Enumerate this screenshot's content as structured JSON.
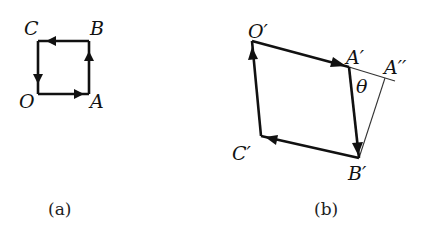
{
  "figure_a": {
    "caption": "(a)",
    "labels": {
      "O": "O",
      "A": "A",
      "B": "B",
      "C": "C"
    },
    "points": {
      "O": [
        38,
        94
      ],
      "A": [
        89,
        94
      ],
      "B": [
        89,
        41
      ],
      "C": [
        38,
        41
      ]
    }
  },
  "figure_b": {
    "caption": "(b)",
    "labels": {
      "O": "O′",
      "A": "A′",
      "B": "B′",
      "C": "C′",
      "A2": "A′′",
      "theta": "θ"
    },
    "points": {
      "O": [
        252,
        41
      ],
      "A": [
        349,
        67
      ],
      "B": [
        359,
        158
      ],
      "C": [
        261,
        136
      ],
      "A2": [
        385,
        78
      ],
      "line_end": [
        395,
        81
      ]
    }
  },
  "colors": {
    "stroke": "#111111",
    "background": "#ffffff"
  }
}
